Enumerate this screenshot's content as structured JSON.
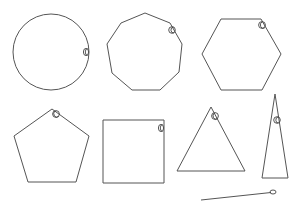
{
  "diagram": {
    "title": "",
    "stroke_color": "#555555",
    "marker_color": "#444444",
    "background": "#ffffff",
    "shapes": [
      {
        "id": "circle",
        "kind": "circle",
        "sides": 0
      },
      {
        "id": "nonagon",
        "kind": "polygon",
        "sides": 9
      },
      {
        "id": "hexagon",
        "kind": "polygon",
        "sides": 6
      },
      {
        "id": "pentagon",
        "kind": "polygon",
        "sides": 5
      },
      {
        "id": "square",
        "kind": "polygon",
        "sides": 4
      },
      {
        "id": "triangle",
        "kind": "polygon",
        "sides": 3
      },
      {
        "id": "tall-triangle",
        "kind": "polygon",
        "sides": 3
      },
      {
        "id": "line-segment",
        "kind": "line",
        "sides": 1
      }
    ]
  }
}
